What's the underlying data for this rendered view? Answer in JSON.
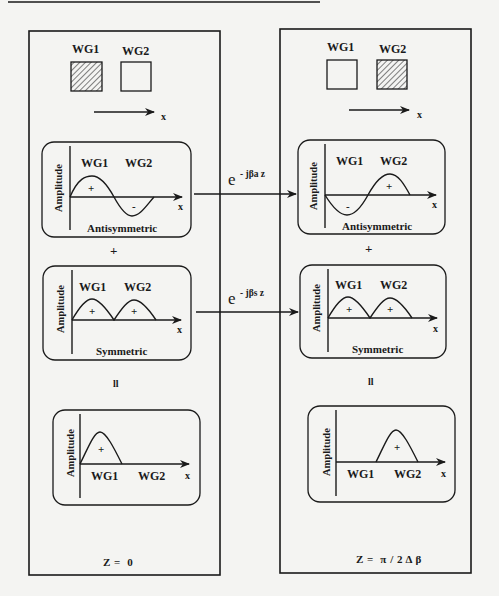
{
  "figure": {
    "left_panel": {
      "title_waveguides": [
        "WG1",
        "WG2"
      ],
      "excited_waveguide": "WG1",
      "axis_label": "x",
      "modes": [
        {
          "name": "Antisymmetric",
          "ylabel": "Amplitude",
          "wg_labels": [
            "WG1",
            "WG2"
          ],
          "signs": [
            "+",
            "-"
          ],
          "x_label": "x"
        },
        {
          "name": "Symmetric",
          "ylabel": "Amplitude",
          "wg_labels": [
            "WG1",
            "WG2"
          ],
          "signs": [
            "+",
            "+"
          ],
          "x_label": "x"
        }
      ],
      "operator_plus": "+",
      "operator_equals": "ll",
      "result": {
        "ylabel": "Amplitude",
        "wg_labels": [
          "WG1",
          "WG2"
        ],
        "sign": "+",
        "x_label": "x"
      },
      "z_label": "Z =  0"
    },
    "right_panel": {
      "title_waveguides": [
        "WG1",
        "WG2"
      ],
      "excited_waveguide": "WG2",
      "axis_label": "x",
      "modes": [
        {
          "name": "Antisymmetric",
          "ylabel": "Amplitude",
          "wg_labels": [
            "WG1",
            "WG2"
          ],
          "signs": [
            "-",
            "+"
          ],
          "x_label": "x"
        },
        {
          "name": "Symmetric",
          "ylabel": "Amplitude",
          "wg_labels": [
            "WG1",
            "WG2"
          ],
          "signs": [
            "+",
            "+"
          ],
          "x_label": "x"
        }
      ],
      "operator_plus": "+",
      "operator_equals": "ll",
      "result": {
        "ylabel": "Amplitude",
        "wg_labels": [
          "WG1",
          "WG2"
        ],
        "sign": "+",
        "x_label": "x"
      },
      "z_label": "Z =  π / 2 Δ β"
    },
    "propagators": [
      {
        "base": "e",
        "exponent": "- jβa z"
      },
      {
        "base": "e",
        "exponent": "- jβs z"
      }
    ]
  }
}
